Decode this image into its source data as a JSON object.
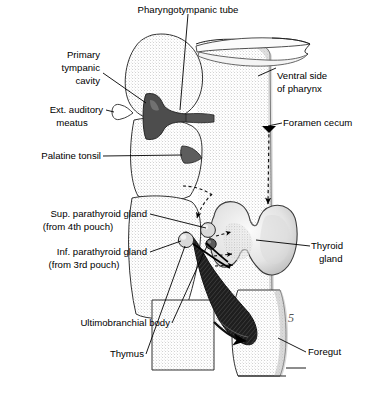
{
  "figure": {
    "domain": "anatomical-diagram",
    "background_color": "#ffffff",
    "width": 375,
    "height": 397
  },
  "labels": {
    "pharyngotympanic_tube": "Pharyngotympanic tube",
    "primary_tympanic_cavity_line1": "Primary",
    "primary_tympanic_cavity_line2": "tympanic",
    "primary_tympanic_cavity_line3": "cavity",
    "ext_auditory_meatus_line1": "Ext. auditory",
    "ext_auditory_meatus_line2": "meatus",
    "palatine_tonsil": "Palatine tonsil",
    "ventral_side_line1": "Ventral side",
    "ventral_side_line2": "of pharynx",
    "foramen_cecum": "Foramen cecum",
    "sup_parathyroid_line1": "Sup. parathyroid gland",
    "sup_parathyroid_line2": "(from 4th pouch)",
    "inf_parathyroid_line1": "Inf. parathyroid gland",
    "inf_parathyroid_line2": "(from 3rd pouch)",
    "thyroid_gland_line1": "Thyroid",
    "thyroid_gland_line2": "gland",
    "ultimobranchial_body": "Ultimobranchial body",
    "thymus": "Thymus",
    "foregut": "Foregut",
    "foregut_pouch_number": "5"
  },
  "colors": {
    "ink": "#000000",
    "outline": "#222222",
    "stipple_light": "#e8e8e8",
    "stipple_mid": "#d4d4d4",
    "tympanic_dark": "#4a4a4a",
    "tonsil_dark": "#5a5a5a",
    "thymus_dark": "#2a2a2a",
    "parathyroid_fill": "#d8d8d8",
    "ultimobranchial_fill": "#555555",
    "thyroid_fill": "#ececec",
    "shadow_gray": "#b8b8b8"
  },
  "structures": [
    {
      "name": "pharyngotympanic-tube",
      "kind": "duct",
      "fill": "tympanic_dark"
    },
    {
      "name": "primary-tympanic-cavity",
      "kind": "cavity",
      "fill": "tympanic_dark"
    },
    {
      "name": "ext-auditory-meatus",
      "kind": "canal",
      "fill": "white"
    },
    {
      "name": "palatine-tonsil",
      "kind": "lymphoid",
      "fill": "tonsil_dark"
    },
    {
      "name": "sup-parathyroid-gland",
      "kind": "gland",
      "pouch": "4th",
      "fill": "parathyroid_fill"
    },
    {
      "name": "inf-parathyroid-gland",
      "kind": "gland",
      "pouch": "3rd",
      "fill": "parathyroid_fill"
    },
    {
      "name": "ultimobranchial-body",
      "kind": "body",
      "fill": "ultimobranchial_fill"
    },
    {
      "name": "thymus",
      "kind": "gland",
      "pouch": "3rd",
      "fill": "thymus_dark"
    },
    {
      "name": "thyroid-gland",
      "kind": "gland",
      "fill": "thyroid_fill"
    },
    {
      "name": "foregut",
      "kind": "tube",
      "fill": "stipple_light"
    },
    {
      "name": "pharynx-wall",
      "kind": "wall",
      "fill": "stipple_light"
    },
    {
      "name": "foramen-cecum",
      "kind": "landmark",
      "fill": "none"
    }
  ],
  "migration_arrows": [
    {
      "name": "foramen-cecum-descent",
      "style": "dashed",
      "from": "foramen cecum",
      "to": "thyroid gland",
      "direction": "down"
    },
    {
      "name": "sup-parathyroid-migration",
      "style": "dashed",
      "direction": "down-left"
    },
    {
      "name": "parathyroid-to-thyroid-upper",
      "style": "dashed",
      "direction": "right"
    },
    {
      "name": "parathyroid-to-thyroid-middle",
      "style": "dashed",
      "direction": "right"
    },
    {
      "name": "ultimobranchial-to-thyroid",
      "style": "dashed",
      "direction": "right"
    },
    {
      "name": "thymus-descent",
      "style": "solid",
      "direction": "down-right"
    }
  ]
}
